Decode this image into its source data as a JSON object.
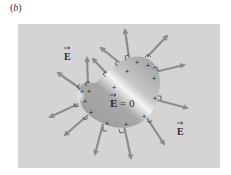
{
  "figure": {
    "panel_label": "b",
    "panel_label_open": "(",
    "panel_label_close": ")",
    "background_color": "#d4d4d4",
    "arrow_color": "#8c8c8c",
    "conductor": {
      "description": "irregularly shaped conductor with surface charges",
      "inside_label": "E = 0",
      "inside_label_vector": "E",
      "inside_label_rest": " = 0",
      "charge_symbol": "+"
    },
    "field_labels": [
      {
        "text": "E",
        "position": "upper-left"
      },
      {
        "text": "E",
        "position": "lower-right"
      }
    ],
    "caption_summary": "Electric field lines leave the conductor surface perpendicular to it; field inside is zero"
  }
}
